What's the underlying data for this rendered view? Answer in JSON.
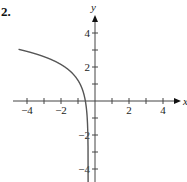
{
  "problem_number": "2.",
  "chart_data": {
    "type": "line",
    "title": "",
    "xlabel": "x",
    "ylabel": "y",
    "xlim": [
      -4.5,
      4.7
    ],
    "ylim": [
      -4.5,
      4.8
    ],
    "x_ticks": [
      -4,
      -3,
      -2,
      -1,
      1,
      2,
      3,
      4
    ],
    "x_tick_labels": [
      "-4",
      "-2",
      "2",
      "4"
    ],
    "y_ticks": [
      -4,
      -3,
      -2,
      -1,
      1,
      2,
      3,
      4
    ],
    "y_tick_labels": [
      "4",
      "2",
      "-2",
      "-4"
    ],
    "grid": false,
    "series": [
      {
        "name": "curve",
        "color": "#555555",
        "vertical_asymptote": -0.4,
        "x": [
          -4.5,
          -4,
          -3,
          -2,
          -1,
          -0.55,
          -0.45,
          -0.42
        ],
        "y": [
          3.0,
          2.9,
          2.6,
          2.3,
          1.4,
          0.0,
          -2.0,
          -4.5
        ]
      }
    ]
  },
  "axis": {
    "x_label": "x",
    "y_label": "y"
  },
  "ticks": {
    "x": [
      {
        "v": -4,
        "t": "−4"
      },
      {
        "v": -2,
        "t": "−2"
      },
      {
        "v": 2,
        "t": "2"
      },
      {
        "v": 4,
        "t": "4"
      }
    ],
    "y": [
      {
        "v": 4,
        "t": "4"
      },
      {
        "v": 2,
        "t": "2"
      },
      {
        "v": -2,
        "t": "−2"
      },
      {
        "v": -4,
        "t": "−4"
      }
    ]
  }
}
